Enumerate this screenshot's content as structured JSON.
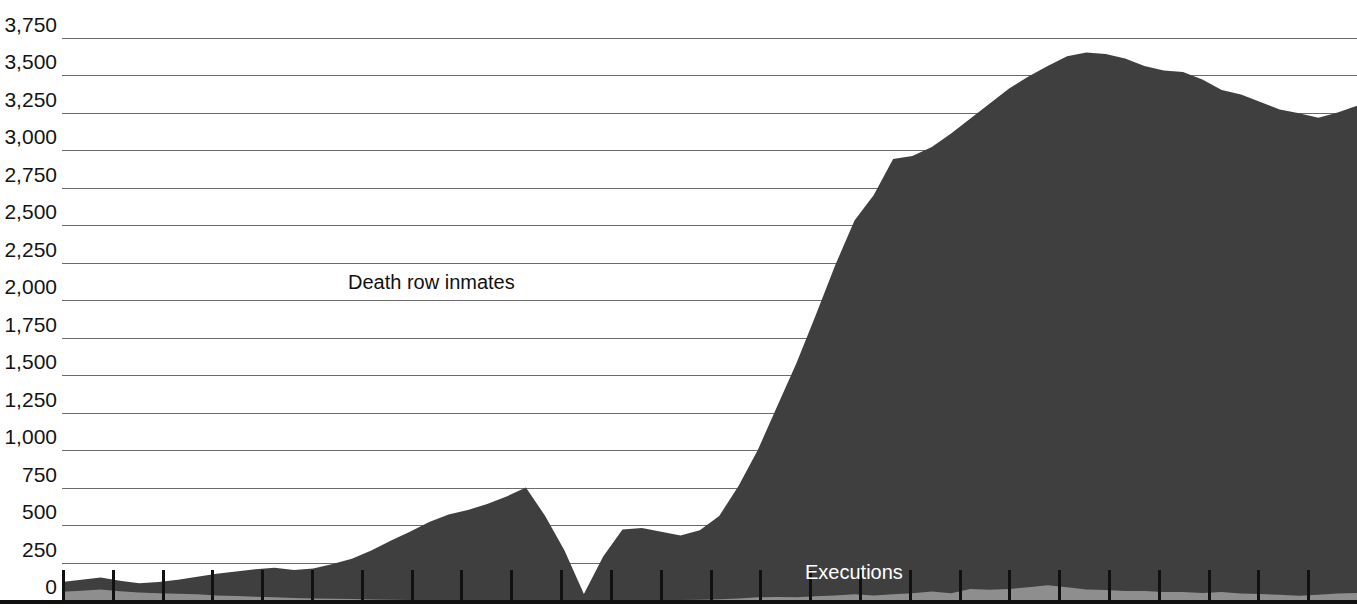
{
  "chart_data": {
    "type": "area",
    "title": "",
    "subtitle": "",
    "xlabel": "",
    "ylabel": "",
    "ylim": [
      0,
      3750
    ],
    "grid": true,
    "stacked": false,
    "legend_position": "inline-annotations",
    "y_ticks": [
      0,
      250,
      500,
      750,
      1000,
      1250,
      1500,
      1750,
      2000,
      2250,
      2500,
      2750,
      3000,
      3250,
      3500,
      3750
    ],
    "y_tick_labels": [
      "0",
      "250",
      "750",
      "500",
      "1,000",
      "1,250",
      "1,500",
      "1,750",
      "2,000",
      "2,250",
      "2,500",
      "2,750",
      "3,000",
      "3,250",
      "3,500",
      "3,750"
    ],
    "axis_tick_labels": [
      "3,750",
      "3,500",
      "3,250",
      "3,000",
      "2,750",
      "2,500",
      "2,250",
      "2,000",
      "1,750",
      "1,500",
      "1,250",
      "1,000",
      "750",
      "500",
      "250",
      "0"
    ],
    "x_tick_count": 27,
    "colors": {
      "inmates_area": "#3f3f3f",
      "executions_area": "#8e8e8e",
      "gridline": "#6b6b6b",
      "baseline": "#111111",
      "background": "#ffffff",
      "inmates_label": "#111111",
      "executions_label": "#ffffff"
    },
    "series": [
      {
        "name": "Death row inmates",
        "label": "Death row inmates",
        "color": "#3f3f3f",
        "values": [
          120,
          135,
          150,
          128,
          112,
          120,
          135,
          155,
          175,
          190,
          205,
          215,
          200,
          210,
          240,
          275,
          330,
          395,
          455,
          520,
          570,
          600,
          640,
          690,
          750,
          560,
          330,
          40,
          290,
          470,
          480,
          455,
          430,
          465,
          560,
          760,
          1000,
          1290,
          1580,
          1900,
          2230,
          2530,
          2700,
          2940,
          2960,
          3020,
          3110,
          3210,
          3310,
          3410,
          3490,
          3560,
          3625,
          3650,
          3640,
          3610,
          3560,
          3530,
          3520,
          3470,
          3400,
          3370,
          3320,
          3270,
          3245,
          3215,
          3250,
          3295
        ]
      },
      {
        "name": "Executions",
        "label": "Executions",
        "color": "#8e8e8e",
        "values": [
          55,
          62,
          70,
          58,
          50,
          45,
          42,
          38,
          30,
          26,
          22,
          18,
          14,
          10,
          8,
          6,
          4,
          2,
          1,
          0,
          0,
          0,
          0,
          0,
          0,
          0,
          0,
          0,
          0,
          0,
          0,
          0,
          1,
          2,
          5,
          11,
          18,
          21,
          18,
          25,
          31,
          38,
          31,
          38,
          45,
          56,
          45,
          74,
          68,
          74,
          85,
          98,
          85,
          71,
          66,
          60,
          59,
          53,
          53,
          46,
          53,
          43,
          39,
          35,
          28,
          35,
          43,
          46
        ]
      }
    ]
  },
  "annotations": {
    "inmates": {
      "text": "Death row inmates",
      "x": 348,
      "y": 272
    },
    "executions": {
      "text": "Executions",
      "x": 805,
      "y": 562
    }
  },
  "axis": {
    "labels": [
      "3,750",
      "3,500",
      "3,250",
      "3,000",
      "2,750",
      "2,500",
      "2,250",
      "2,000",
      "1,750",
      "1,500",
      "1,250",
      "1,000",
      "750",
      "500",
      "250",
      "0"
    ]
  }
}
